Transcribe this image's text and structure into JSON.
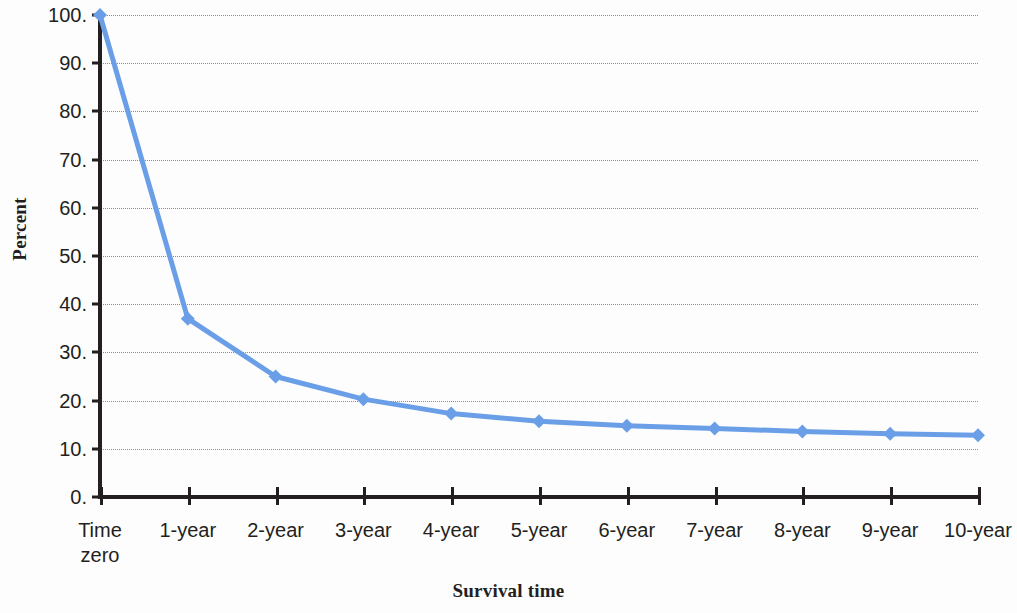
{
  "chart_data": {
    "type": "line",
    "title": "",
    "xlabel": "Survival time",
    "ylabel": "Percent",
    "categories": [
      "Time zero",
      "1-year",
      "2-year",
      "3-year",
      "4-year",
      "5-year",
      "6-year",
      "7-year",
      "8-year",
      "9-year",
      "10-year"
    ],
    "series": [
      {
        "name": "Percent surviving",
        "values": [
          100,
          37,
          25,
          20.3,
          17.3,
          15.7,
          14.8,
          14.2,
          13.6,
          13.1,
          12.8
        ]
      }
    ],
    "ylim": [
      0,
      100
    ],
    "ytick_values": [
      0,
      10,
      20,
      30,
      40,
      50,
      60,
      70,
      80,
      90,
      100
    ],
    "ytick_labels": [
      "0.",
      "10.",
      "20.",
      "30.",
      "40.",
      "50.",
      "60.",
      "70.",
      "80.",
      "90.",
      "100."
    ],
    "grid": true,
    "grid_axis": "y",
    "legend": false,
    "legend_position": "none",
    "marker": "diamond",
    "line_color": "#6a9fe8",
    "marker_color": "#6a9fe8",
    "grid_color": "#8b8b8b",
    "axis_color": "#231f20",
    "background_color": "#fdfdfd",
    "text_color": "#231f20"
  },
  "axis": {
    "y_title": "Percent",
    "x_title": "Survival time"
  },
  "x_tick_labels": [
    {
      "line1": "Time",
      "line2": "zero"
    },
    {
      "line1": "1-year",
      "line2": ""
    },
    {
      "line1": "2-year",
      "line2": ""
    },
    {
      "line1": "3-year",
      "line2": ""
    },
    {
      "line1": "4-year",
      "line2": ""
    },
    {
      "line1": "5-year",
      "line2": ""
    },
    {
      "line1": "6-year",
      "line2": ""
    },
    {
      "line1": "7-year",
      "line2": ""
    },
    {
      "line1": "8-year",
      "line2": ""
    },
    {
      "line1": "9-year",
      "line2": ""
    },
    {
      "line1": "10-year",
      "line2": ""
    }
  ]
}
